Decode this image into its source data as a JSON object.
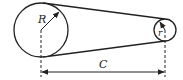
{
  "diagram": {
    "type": "belt-drive",
    "large_pulley": {
      "label": "R",
      "cx": 41,
      "cy": 30,
      "r": 27
    },
    "small_pulley": {
      "label": "r",
      "cx": 165,
      "cy": 30,
      "r": 11
    },
    "center_distance": {
      "label": "C"
    },
    "colors": {
      "stroke": "#222222",
      "background": "#ffffff"
    }
  }
}
